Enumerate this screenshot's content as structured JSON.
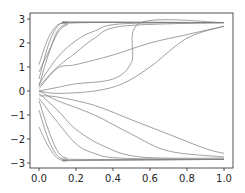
{
  "chart_data": {
    "type": "line",
    "title": "",
    "xlabel": "",
    "ylabel": "",
    "xlim": [
      -0.05,
      1.05
    ],
    "ylim": [
      -3.15,
      3.15
    ],
    "grid": false,
    "legend": null,
    "line_color": "#808080",
    "x_ticks": [
      0.0,
      0.2,
      0.4,
      0.6,
      0.8,
      1.0
    ],
    "x_tick_labels": [
      "0.0",
      "0.2",
      "0.4",
      "0.6",
      "0.8",
      "1.0"
    ],
    "y_ticks": [
      3,
      2,
      1,
      0,
      -1,
      -2,
      -3
    ],
    "y_tick_labels": [
      "3",
      "2",
      "1",
      "0",
      "−1",
      "−2",
      "−3"
    ],
    "series": [
      {
        "name": "up-fast-1",
        "x": [
          0,
          0.05,
          0.1,
          0.15,
          0.2,
          1.0
        ],
        "y": [
          1.1,
          2.2,
          2.75,
          2.85,
          2.87,
          2.85
        ]
      },
      {
        "name": "up-fast-2",
        "x": [
          0,
          0.05,
          0.1,
          0.15,
          0.2,
          1.0
        ],
        "y": [
          0.5,
          1.9,
          2.7,
          2.85,
          2.87,
          2.85
        ]
      },
      {
        "name": "up-fast-3",
        "x": [
          0,
          0.05,
          0.1,
          0.15,
          0.2,
          1.0
        ],
        "y": [
          0.2,
          1.5,
          2.5,
          2.8,
          2.85,
          2.85
        ]
      },
      {
        "name": "up-fast-4",
        "x": [
          0,
          0.05,
          0.1,
          0.15,
          0.25,
          1.0
        ],
        "y": [
          0.8,
          1.6,
          2.4,
          2.75,
          2.85,
          2.85
        ]
      },
      {
        "name": "up-mid-1",
        "x": [
          0,
          0.1,
          0.2,
          0.3,
          0.45,
          1.0
        ],
        "y": [
          0.3,
          1.4,
          2.1,
          2.5,
          2.8,
          2.85
        ]
      },
      {
        "name": "up-mid-2",
        "x": [
          0,
          0.1,
          0.2,
          0.3,
          0.45,
          1.0
        ],
        "y": [
          0.2,
          1.0,
          1.6,
          2.2,
          2.7,
          2.85
        ]
      },
      {
        "name": "up-slow-1",
        "x": [
          0,
          0.1,
          0.2,
          0.4,
          0.6,
          0.8,
          1.0
        ],
        "y": [
          0.1,
          0.95,
          1.1,
          1.5,
          2.0,
          2.35,
          2.7
        ]
      },
      {
        "name": "up-slow-2",
        "x": [
          0,
          0.1,
          0.2,
          0.4,
          0.5,
          0.55,
          1.0
        ],
        "y": [
          0.0,
          0.15,
          0.3,
          0.5,
          1.2,
          2.85,
          2.85
        ]
      },
      {
        "name": "up-slow-3",
        "x": [
          0,
          0.1,
          0.3,
          0.45,
          0.6,
          0.8,
          1.0
        ],
        "y": [
          0.0,
          -0.1,
          0.0,
          0.3,
          1.0,
          2.2,
          2.7
        ]
      },
      {
        "name": "flat-to-low",
        "x": [
          0,
          0.1,
          0.3,
          0.5,
          0.7,
          0.9,
          1.0
        ],
        "y": [
          -0.2,
          -0.25,
          -0.6,
          -1.2,
          -1.8,
          -2.4,
          -2.6
        ]
      },
      {
        "name": "down-fast-1",
        "x": [
          0,
          0.05,
          0.1,
          0.15,
          0.2,
          1.0
        ],
        "y": [
          -1.5,
          -2.3,
          -2.8,
          -2.9,
          -2.9,
          -2.85
        ]
      },
      {
        "name": "down-fast-2",
        "x": [
          0,
          0.05,
          0.1,
          0.15,
          0.2,
          1.0
        ],
        "y": [
          -0.8,
          -2.0,
          -2.7,
          -2.85,
          -2.88,
          -2.85
        ]
      },
      {
        "name": "down-fast-3",
        "x": [
          0,
          0.05,
          0.1,
          0.15,
          0.25,
          1.0
        ],
        "y": [
          -0.4,
          -1.6,
          -2.5,
          -2.8,
          -2.85,
          -2.85
        ]
      },
      {
        "name": "down-mid-1",
        "x": [
          0,
          0.1,
          0.2,
          0.3,
          0.45,
          1.0
        ],
        "y": [
          -0.3,
          -1.3,
          -2.2,
          -2.6,
          -2.8,
          -2.85
        ]
      },
      {
        "name": "down-mid-2",
        "x": [
          0,
          0.1,
          0.2,
          0.35,
          0.55,
          1.0
        ],
        "y": [
          -0.1,
          -0.8,
          -1.6,
          -2.3,
          -2.75,
          -2.8
        ]
      },
      {
        "name": "down-slow-1",
        "x": [
          0,
          0.1,
          0.3,
          0.5,
          0.7,
          1.0
        ],
        "y": [
          0.0,
          -0.4,
          -1.0,
          -1.8,
          -2.5,
          -2.75
        ]
      }
    ]
  }
}
